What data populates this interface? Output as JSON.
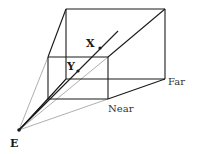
{
  "diagram": {
    "colors": {
      "edge": "#1a1a1a",
      "guide": "#9a9a9a",
      "background": "#ffffff"
    },
    "points": {
      "eye": {
        "label": "E",
        "x": 19,
        "y": 130
      },
      "x_point": {
        "label": "X",
        "x": 100,
        "y": 48
      },
      "y_point": {
        "label": "Y",
        "x": 78,
        "y": 71
      }
    },
    "planes": {
      "near": {
        "label": "Near",
        "x1": 48,
        "y1": 57,
        "x2": 108,
        "y2": 99
      },
      "far": {
        "label": "Far",
        "x1": 66,
        "y1": 9,
        "x2": 165,
        "y2": 79
      }
    },
    "labels": {
      "eye": "E",
      "x": "X",
      "y": "Y",
      "near": "Near",
      "far": "Far"
    }
  }
}
